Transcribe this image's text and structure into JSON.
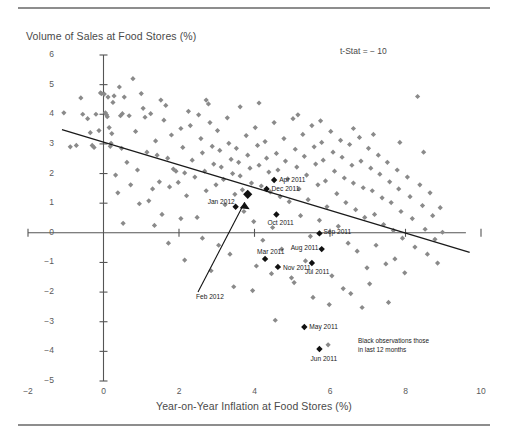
{
  "figure": {
    "y_axis_title": "Volume of Sales at Food Stores (%)",
    "x_axis_title": "Year-on-Year Inflation at Food Stores (%)",
    "tstat_annotation": "t-Stat = − 10",
    "legend_note_line1": "Black observations those",
    "legend_note_line2": "in last 12 months"
  },
  "chart_data": {
    "type": "scatter",
    "title": "",
    "xlabel": "Year-on-Year Inflation at Food Stores (%)",
    "ylabel": "Volume of Sales at Food Stores (%)",
    "xlim": [
      -2,
      10
    ],
    "ylim": [
      -5,
      6
    ],
    "xticks": [
      -2,
      0,
      2,
      4,
      6,
      8,
      10
    ],
    "yticks": [
      6,
      5,
      4,
      3,
      2,
      1,
      0,
      -1,
      -2,
      -3,
      -4,
      -5
    ],
    "grid": false,
    "legend_position": "bottom-right",
    "annotations": [
      {
        "text": "t-Stat = − 10",
        "x": 6.6,
        "y": 5.4
      },
      {
        "text": "Black observations those in last 12 months",
        "x": 8.4,
        "y": -3.6
      }
    ],
    "trendline": {
      "name": "regression-line",
      "x": [
        -1.1,
        9.7
      ],
      "y": [
        3.48,
        -0.66
      ],
      "color": "#1a1a1a"
    },
    "series": [
      {
        "name": "Historic observations",
        "color": "#8a8a8a",
        "marker": "diamond",
        "points": [
          [
            -1.05,
            4.05
          ],
          [
            -0.6,
            4.55
          ],
          [
            -0.55,
            4.0
          ],
          [
            -0.42,
            3.85
          ],
          [
            -0.3,
            2.95
          ],
          [
            -0.25,
            2.88
          ],
          [
            -0.2,
            4.0
          ],
          [
            -0.12,
            3.45
          ],
          [
            -0.08,
            4.72
          ],
          [
            -0.05,
            4.7
          ],
          [
            0.02,
            4.68
          ],
          [
            0.05,
            4.05
          ],
          [
            0.08,
            3.98
          ],
          [
            0.1,
            3.92
          ],
          [
            0.12,
            4.58
          ],
          [
            0.15,
            3.55
          ],
          [
            0.18,
            2.92
          ],
          [
            0.22,
            3.35
          ],
          [
            0.25,
            4.4
          ],
          [
            0.28,
            4.62
          ],
          [
            0.32,
            1.95
          ],
          [
            0.38,
            1.35
          ],
          [
            0.45,
            3.95
          ],
          [
            0.5,
            4.02
          ],
          [
            0.55,
            4.58
          ],
          [
            0.62,
            2.38
          ],
          [
            0.68,
            3.95
          ],
          [
            0.72,
            1.62
          ],
          [
            0.78,
            5.2
          ],
          [
            0.85,
            3.42
          ],
          [
            0.9,
            2.12
          ],
          [
            0.95,
            0.98
          ],
          [
            1.0,
            4.7
          ],
          [
            1.05,
            4.2
          ],
          [
            1.1,
            3.9
          ],
          [
            1.15,
            2.72
          ],
          [
            1.2,
            1.08
          ],
          [
            1.25,
            4.02
          ],
          [
            1.3,
            1.48
          ],
          [
            1.38,
            3.1
          ],
          [
            1.42,
            2.62
          ],
          [
            1.48,
            1.72
          ],
          [
            1.55,
            0.62
          ],
          [
            1.6,
            3.8
          ],
          [
            1.65,
            4.3
          ],
          [
            1.7,
            2.52
          ],
          [
            1.75,
            1.55
          ],
          [
            1.8,
            3.3
          ],
          [
            1.85,
            2.15
          ],
          [
            1.92,
            2.08
          ],
          [
            1.98,
            1.7
          ],
          [
            2.05,
            3.52
          ],
          [
            2.1,
            2.88
          ],
          [
            2.15,
            2.02
          ],
          [
            2.2,
            1.25
          ],
          [
            2.25,
            4.1
          ],
          [
            2.3,
            3.62
          ],
          [
            2.35,
            2.45
          ],
          [
            2.42,
            1.88
          ],
          [
            2.48,
            0.52
          ],
          [
            2.52,
            3.98
          ],
          [
            2.58,
            3.18
          ],
          [
            2.62,
            2.7
          ],
          [
            2.68,
            2.08
          ],
          [
            2.72,
            1.42
          ],
          [
            2.78,
            4.35
          ],
          [
            2.82,
            3.72
          ],
          [
            2.88,
            2.92
          ],
          [
            2.92,
            2.32
          ],
          [
            2.98,
            1.62
          ],
          [
            3.02,
            3.45
          ],
          [
            3.08,
            2.78
          ],
          [
            3.12,
            2.22
          ],
          [
            3.18,
            1.8
          ],
          [
            3.22,
            0.95
          ],
          [
            3.28,
            3.88
          ],
          [
            3.32,
            3.02
          ],
          [
            3.38,
            2.48
          ],
          [
            3.42,
            2.0
          ],
          [
            3.48,
            1.3
          ],
          [
            3.52,
            2.85
          ],
          [
            3.58,
            2.38
          ],
          [
            3.62,
            1.92
          ],
          [
            3.68,
            1.45
          ],
          [
            3.72,
            0.72
          ],
          [
            3.78,
            3.28
          ],
          [
            3.82,
            2.62
          ],
          [
            3.88,
            2.18
          ],
          [
            3.92,
            1.68
          ],
          [
            3.98,
            0.38
          ],
          [
            4.02,
            3.55
          ],
          [
            4.08,
            2.95
          ],
          [
            4.12,
            2.28
          ],
          [
            4.18,
            1.58
          ],
          [
            4.22,
            -0.25
          ],
          [
            4.28,
            3.08
          ],
          [
            4.32,
            2.52
          ],
          [
            4.38,
            2.05
          ],
          [
            4.42,
            1.38
          ],
          [
            4.48,
            0.18
          ],
          [
            4.52,
            3.72
          ],
          [
            4.58,
            2.68
          ],
          [
            4.62,
            2.12
          ],
          [
            4.68,
            1.22
          ],
          [
            4.72,
            -0.55
          ],
          [
            4.78,
            3.18
          ],
          [
            4.82,
            2.42
          ],
          [
            4.88,
            1.82
          ],
          [
            4.92,
            1.05
          ],
          [
            4.98,
            -1.52
          ],
          [
            5.02,
            3.85
          ],
          [
            5.08,
            2.82
          ],
          [
            5.12,
            2.22
          ],
          [
            5.18,
            1.48
          ],
          [
            5.22,
            0.58
          ],
          [
            5.28,
            3.32
          ],
          [
            5.32,
            2.58
          ],
          [
            5.38,
            1.95
          ],
          [
            5.42,
            1.12
          ],
          [
            5.48,
            -0.12
          ],
          [
            5.52,
            3.62
          ],
          [
            5.58,
            2.9
          ],
          [
            5.62,
            2.32
          ],
          [
            5.68,
            1.62
          ],
          [
            5.72,
            0.42
          ],
          [
            5.78,
            3.05
          ],
          [
            5.82,
            2.45
          ],
          [
            5.88,
            1.75
          ],
          [
            5.92,
            0.88
          ],
          [
            5.98,
            -2.42
          ],
          [
            6.02,
            3.42
          ],
          [
            6.08,
            2.72
          ],
          [
            6.12,
            2.08
          ],
          [
            6.18,
            1.32
          ],
          [
            6.22,
            0.22
          ],
          [
            6.28,
            3.12
          ],
          [
            6.32,
            2.55
          ],
          [
            6.38,
            1.85
          ],
          [
            6.42,
            1.02
          ],
          [
            6.48,
            -0.35
          ],
          [
            6.52,
            2.98
          ],
          [
            6.58,
            2.28
          ],
          [
            6.62,
            1.68
          ],
          [
            6.68,
            0.78
          ],
          [
            6.72,
            -0.62
          ],
          [
            6.78,
            3.22
          ],
          [
            6.82,
            2.42
          ],
          [
            6.88,
            1.52
          ],
          [
            6.92,
            0.52
          ],
          [
            6.98,
            -1.18
          ],
          [
            7.02,
            2.85
          ],
          [
            7.08,
            2.18
          ],
          [
            7.12,
            1.42
          ],
          [
            7.18,
            0.62
          ],
          [
            7.22,
            -0.42
          ],
          [
            7.28,
            2.62
          ],
          [
            7.32,
            1.98
          ],
          [
            7.38,
            1.18
          ],
          [
            7.42,
            0.28
          ],
          [
            7.48,
            -1.05
          ],
          [
            7.52,
            2.38
          ],
          [
            7.58,
            1.72
          ],
          [
            7.62,
            1.02
          ],
          [
            7.68,
            0.08
          ],
          [
            7.72,
            -0.88
          ],
          [
            7.78,
            2.12
          ],
          [
            7.82,
            1.48
          ],
          [
            7.88,
            0.72
          ],
          [
            7.92,
            -0.18
          ],
          [
            7.98,
            -1.35
          ],
          [
            8.05,
            1.88
          ],
          [
            8.12,
            1.22
          ],
          [
            8.18,
            0.48
          ],
          [
            8.25,
            -0.48
          ],
          [
            8.32,
            4.6
          ],
          [
            8.38,
            1.62
          ],
          [
            8.45,
            0.92
          ],
          [
            8.52,
            0.12
          ],
          [
            8.58,
            -0.72
          ],
          [
            8.65,
            1.35
          ],
          [
            8.72,
            0.58
          ],
          [
            8.78,
            -0.22
          ],
          [
            8.85,
            -1.02
          ],
          [
            8.92,
            0.85
          ],
          [
            8.98,
            0.02
          ],
          [
            0.48,
            2.85
          ],
          [
            0.52,
            0.32
          ],
          [
            1.35,
            0.25
          ],
          [
            2.05,
            0.48
          ],
          [
            2.62,
            -0.18
          ],
          [
            3.05,
            -0.42
          ],
          [
            3.45,
            -1.82
          ],
          [
            4.05,
            -1.12
          ],
          [
            4.55,
            -2.95
          ],
          [
            5.05,
            -1.68
          ],
          [
            5.55,
            -2.18
          ],
          [
            6.05,
            -1.45
          ],
          [
            6.55,
            -2.05
          ],
          [
            7.05,
            -1.72
          ],
          [
            7.55,
            -2.35
          ],
          [
            1.72,
            -0.35
          ],
          [
            2.15,
            -0.92
          ],
          [
            2.85,
            -1.28
          ],
          [
            3.35,
            -0.72
          ],
          [
            3.95,
            -1.95
          ],
          [
            4.45,
            -1.38
          ],
          [
            5.35,
            -0.95
          ],
          [
            5.95,
            -3.78
          ],
          [
            6.35,
            -1.88
          ],
          [
            6.85,
            -2.52
          ],
          [
            -0.88,
            2.9
          ],
          [
            -0.72,
            2.95
          ],
          [
            -0.35,
            3.38
          ],
          [
            0.2,
            3.02
          ],
          [
            0.42,
            4.92
          ],
          [
            1.52,
            4.48
          ],
          [
            2.72,
            4.48
          ],
          [
            3.62,
            4.25
          ],
          [
            4.12,
            4.38
          ],
          [
            5.15,
            3.98
          ],
          [
            5.75,
            3.78
          ],
          [
            6.62,
            3.52
          ],
          [
            7.15,
            3.32
          ],
          [
            7.85,
            3.05
          ],
          [
            8.48,
            2.72
          ]
        ]
      },
      {
        "name": "Last 12 months observations",
        "color": "#111111",
        "marker": "diamond-large",
        "points": [
          {
            "label": "Apr 2011",
            "x": 4.52,
            "y": 1.78,
            "label_pos": "right"
          },
          {
            "label": "Dec 2011",
            "x": 4.32,
            "y": 1.48,
            "label_pos": "right"
          },
          {
            "label": "Jan 2012",
            "x": 3.5,
            "y": 0.88,
            "label_pos": "left"
          },
          {
            "label": "Feb 2012",
            "x": 3.82,
            "y": 1.3,
            "label_pos": "arrow"
          },
          {
            "label": "Oct 2011",
            "x": 4.58,
            "y": 0.62,
            "label_pos": "below"
          },
          {
            "label": "Sep 2011",
            "x": 5.72,
            "y": -0.02,
            "label_pos": "right"
          },
          {
            "label": "Aug 2011",
            "x": 5.78,
            "y": -0.55,
            "label_pos": "left"
          },
          {
            "label": "Mar 2011",
            "x": 4.28,
            "y": -0.88,
            "label_pos": "above"
          },
          {
            "label": "Nov 2011",
            "x": 4.62,
            "y": -1.15,
            "label_pos": "right"
          },
          {
            "label": "Jul 2011",
            "x": 5.52,
            "y": -1.02,
            "label_pos": "below"
          },
          {
            "label": "May 2011",
            "x": 5.32,
            "y": -3.18,
            "label_pos": "right"
          },
          {
            "label": "Jun 2011",
            "x": 5.72,
            "y": -3.92,
            "label_pos": "below"
          }
        ]
      }
    ]
  },
  "y_tick_labels": [
    "6",
    "5",
    "4",
    "3",
    "2",
    "1",
    "0",
    "−1",
    "−2",
    "−3",
    "−4",
    "−5"
  ],
  "x_tick_labels": [
    "−2",
    "0",
    "2",
    "4",
    "6",
    "8",
    "10"
  ],
  "point_labels": {
    "apr2011": "Apr 2011",
    "dec2011": "Dec 2011",
    "jan2012": "Jan 2012",
    "feb2012": "Feb 2012",
    "oct2011": "Oct 2011",
    "sep2011": "Sep 2011",
    "aug2011": "Aug 2011",
    "mar2011": "Mar 2011",
    "nov2011": "Nov 2011",
    "jul2011": "Jul 2011",
    "may2011": "May 2011",
    "jun2011": "Jun 2011"
  },
  "colors": {
    "historic_marker": "#8a8a8a",
    "recent_marker": "#111111",
    "axis": "#555555",
    "rule": "#8d8d8d",
    "text": "#4a4a4a"
  }
}
